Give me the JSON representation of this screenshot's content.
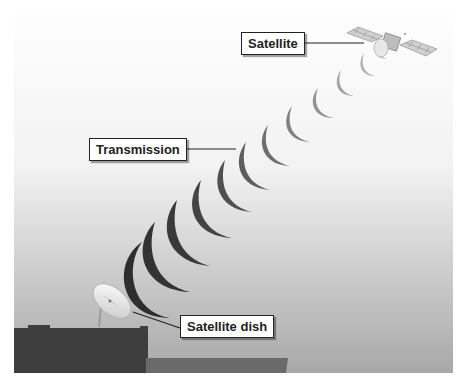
{
  "diagram": {
    "labels": {
      "satellite": "Satellite",
      "transmission": "Transmission",
      "dish": "Satellite dish"
    },
    "colors": {
      "sky_top": "#ffffff",
      "sky_bottom": "#a9a9a9",
      "arc_near": "#2e2e2e",
      "arc_far": "#bdbdbd",
      "building": "#3c3c3c",
      "low_roof": "#6a6a6a"
    },
    "arc_count": 12
  }
}
